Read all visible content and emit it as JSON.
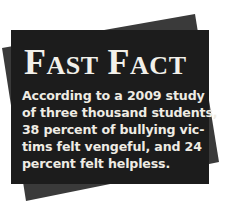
{
  "sidebar_box": {
    "title": {
      "word1_initial": "F",
      "word1_rest": "AST",
      "word2_initial": "F",
      "word2_rest": "ACT",
      "full": "Fast Fact"
    },
    "body_lines": [
      "According to a 2009 study",
      "of three thousand students,",
      "38 percent of bullying vic-",
      "tims felt vengeful, and 24",
      "percent felt helpless."
    ],
    "body_full": "According to a 2009 study of three thousand students, 38 percent of bullying victims felt vengeful, and 24 percent felt helpless."
  },
  "colors": {
    "front_box": "#1c1c1c",
    "back_box": "#3a3a3a",
    "text": "#efece4",
    "page_background": "#ffffff"
  }
}
